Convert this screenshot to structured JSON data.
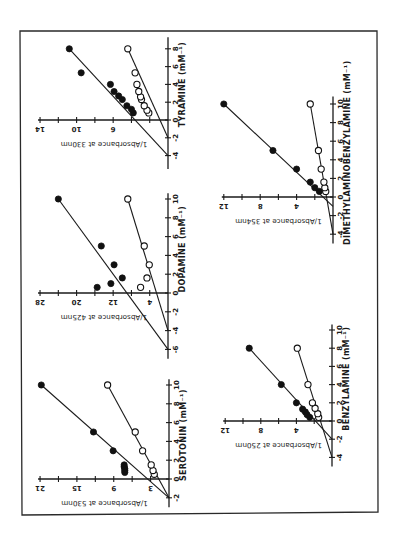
{
  "figure": {
    "orientation": "rotated-90-ccw",
    "frame": {
      "x1": 20,
      "y1": 31,
      "x2": 377,
      "y2": 512
    }
  },
  "chart_data": [
    {
      "type": "scatter",
      "panel": "tyramine",
      "xlabel": "TYRAMINE (mM⁻¹)",
      "ylabel": "1/Absorbance at 330nm",
      "xticks": [
        -4,
        -2,
        0,
        2,
        4,
        6,
        8
      ],
      "yticks": [
        0,
        2,
        4,
        6,
        8,
        10,
        12,
        14
      ],
      "ytick_labels": [
        "6",
        "10",
        "14"
      ],
      "xlim": [
        -4.5,
        9
      ],
      "ylim": [
        0,
        14
      ],
      "layout": {
        "ox": 168,
        "oy": 120,
        "sx": 9.14,
        "sy": 8.9,
        "xmin": -5.5,
        "xmax": 9.3,
        "ymax": 14
      },
      "series": [
        {
          "name": "filled",
          "marker": "filled-circle",
          "points": [
            [
              0.8,
              3.8
            ],
            [
              1.2,
              4.0
            ],
            [
              1.6,
              4.5
            ],
            [
              2.3,
              5.0
            ],
            [
              2.7,
              5.4
            ],
            [
              3.2,
              5.9
            ],
            [
              4.0,
              6.3
            ],
            [
              5.3,
              9.5
            ],
            [
              8.0,
              10.8
            ]
          ],
          "fit": [
            [
              -4,
              0
            ],
            [
              8,
              10.8
            ]
          ]
        },
        {
          "name": "open",
          "marker": "open-circle",
          "points": [
            [
              0.8,
              2.1
            ],
            [
              1.1,
              2.3
            ],
            [
              1.6,
              2.6
            ],
            [
              2.3,
              2.9
            ],
            [
              2.6,
              3.0
            ],
            [
              3.2,
              3.2
            ],
            [
              4.0,
              3.4
            ],
            [
              5.3,
              3.6
            ],
            [
              8.0,
              4.4
            ]
          ],
          "fit": [
            [
              -2,
              0
            ],
            [
              8,
              4.4
            ]
          ]
        }
      ]
    },
    {
      "type": "scatter",
      "panel": "dopamine",
      "xlabel": "DOPAMINE (mM⁻¹)",
      "ylabel": "1/Absorbance at 425nm",
      "xticks": [
        -6,
        -4,
        -2,
        0,
        2,
        4,
        6,
        8,
        10
      ],
      "yticks": [
        0,
        4,
        8,
        12,
        16,
        20,
        24,
        28
      ],
      "ytick_labels": [
        "4",
        "12",
        "20",
        "28"
      ],
      "xlim": [
        -6.5,
        10
      ],
      "ylim": [
        0,
        28
      ],
      "layout": {
        "ox": 168,
        "oy": 293,
        "sx": 4.57,
        "sy": 9.4,
        "xmin": -7,
        "xmax": 10.6,
        "ymax": 28
      },
      "series": [
        {
          "name": "filled",
          "marker": "filled-circle",
          "points": [
            [
              0.6,
              15.5
            ],
            [
              1.0,
              12.5
            ],
            [
              1.6,
              10.0
            ],
            [
              3.0,
              11.8
            ],
            [
              5.0,
              14.6
            ],
            [
              10.0,
              24.0
            ]
          ],
          "fit": [
            [
              -6,
              0
            ],
            [
              10,
              24.0
            ]
          ]
        },
        {
          "name": "open",
          "marker": "open-circle",
          "points": [
            [
              0.6,
              6.0
            ],
            [
              1.6,
              4.6
            ],
            [
              3.0,
              4.1
            ],
            [
              5.0,
              5.2
            ],
            [
              10.0,
              8.8
            ]
          ],
          "fit": [
            [
              -4,
              0
            ],
            [
              10,
              8.8
            ]
          ]
        }
      ]
    },
    {
      "type": "scatter",
      "panel": "serotonin",
      "xlabel": "SEROTONIN (mM⁻¹)",
      "ylabel": "1/Absorbance at 530nm",
      "xticks": [
        -2,
        0,
        2,
        4,
        6,
        8,
        10
      ],
      "yticks": [
        0,
        3,
        6,
        9,
        12,
        15,
        18,
        21
      ],
      "ytick_labels": [
        "3",
        "9",
        "15",
        "21"
      ],
      "xlim": [
        -2.5,
        10
      ],
      "ylim": [
        0,
        21
      ],
      "layout": {
        "ox": 169,
        "oy": 479,
        "sx": 6.14,
        "sy": 9.4,
        "xmin": -3,
        "xmax": 10.6,
        "ymax": 21
      },
      "series": [
        {
          "name": "filled",
          "marker": "filled-circle",
          "points": [
            [
              0.7,
              7.2
            ],
            [
              0.9,
              7.2
            ],
            [
              1.1,
              7.2
            ],
            [
              1.3,
              7.3
            ],
            [
              1.5,
              7.3
            ],
            [
              3.0,
              9.1
            ],
            [
              5.0,
              12.3
            ],
            [
              10.0,
              20.8
            ]
          ],
          "fit": [
            [
              -2,
              0
            ],
            [
              10,
              20.8
            ]
          ]
        },
        {
          "name": "open",
          "marker": "open-circle",
          "points": [
            [
              0.5,
              2.4
            ],
            [
              0.9,
              2.6
            ],
            [
              1.5,
              2.9
            ],
            [
              3.0,
              4.3
            ],
            [
              5.0,
              5.5
            ],
            [
              10.0,
              10.0
            ]
          ],
          "fit": [
            [
              -2,
              0
            ],
            [
              10,
              10.0
            ]
          ]
        }
      ]
    },
    {
      "type": "scatter",
      "panel": "benzylamine",
      "xlabel": "BENZYLAMINE (mM⁻¹)",
      "ylabel": "1/Absorbance at 250nm",
      "xticks": [
        -4,
        -2,
        0,
        2,
        4,
        6,
        8,
        10
      ],
      "yticks": [
        0,
        2,
        4,
        6,
        8,
        10,
        12
      ],
      "ytick_labels": [
        "4",
        "8",
        "12"
      ],
      "xlim": [
        -4.5,
        10
      ],
      "ylim": [
        0,
        12
      ],
      "layout": {
        "ox": 332,
        "oy": 421,
        "sx": 8.9,
        "sy": 9.1,
        "xmin": -5,
        "xmax": 10.6,
        "ymax": 12
      },
      "series": [
        {
          "name": "filled",
          "marker": "filled-circle",
          "points": [
            [
              0.4,
              2.5
            ],
            [
              0.7,
              2.8
            ],
            [
              1.0,
              3.0
            ],
            [
              1.3,
              3.3
            ],
            [
              2.0,
              4.0
            ],
            [
              4.0,
              5.7
            ],
            [
              8.0,
              9.3
            ]
          ],
          "fit": [
            [
              -2,
              0
            ],
            [
              8,
              9.3
            ]
          ]
        },
        {
          "name": "open",
          "marker": "open-circle",
          "points": [
            [
              0.4,
              1.5
            ],
            [
              0.8,
              1.6
            ],
            [
              1.4,
              1.9
            ],
            [
              2.0,
              2.2
            ],
            [
              4.0,
              2.7
            ],
            [
              8.0,
              3.9
            ]
          ],
          "fit": [
            [
              -4,
              0
            ],
            [
              8,
              3.9
            ]
          ]
        }
      ]
    },
    {
      "type": "scatter",
      "panel": "dimethylaminobenzylamine",
      "xlabel": "DIMETHYLAMINOBENZYLAMINE (mM⁻¹)",
      "ylabel": "1/Absorbance at 354nm",
      "xticks": [
        -4,
        -2,
        0,
        2,
        4,
        6,
        8,
        10
      ],
      "yticks": [
        0,
        2,
        4,
        6,
        8,
        10,
        12
      ],
      "ytick_labels": [
        "4",
        "8",
        "12"
      ],
      "xlim": [
        -4.5,
        10
      ],
      "ylim": [
        0,
        12
      ],
      "layout": {
        "ox": 333,
        "oy": 197,
        "sx": 9.1,
        "sy": 9.3,
        "xmin": -5,
        "xmax": 10.8,
        "ymax": 12
      },
      "series": [
        {
          "name": "filled",
          "marker": "filled-circle",
          "points": [
            [
              0.6,
              1.5
            ],
            [
              1.0,
              2.0
            ],
            [
              1.6,
              2.5
            ],
            [
              3.0,
              4.0
            ],
            [
              5.0,
              6.6
            ],
            [
              10.0,
              12.0
            ]
          ],
          "fit": [
            [
              -1,
              0
            ],
            [
              10,
              12.0
            ]
          ]
        },
        {
          "name": "open",
          "marker": "open-circle",
          "points": [
            [
              0.6,
              0.8
            ],
            [
              1.0,
              0.9
            ],
            [
              1.6,
              1.0
            ],
            [
              3.0,
              1.3
            ],
            [
              5.0,
              1.6
            ],
            [
              10.0,
              2.5
            ]
          ],
          "fit": [
            [
              -4,
              0
            ],
            [
              10,
              2.5
            ]
          ]
        }
      ]
    }
  ]
}
